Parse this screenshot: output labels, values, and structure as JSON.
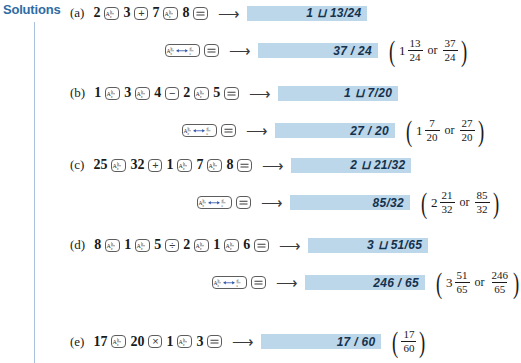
{
  "heading": {
    "label": "Solutions"
  },
  "icons": {
    "abc_key": "fraction-abc-key-icon",
    "toggle_key": "fraction-toggle-key-icon",
    "equals_key": "equals-key-icon",
    "arrow": "right-arrow-icon"
  },
  "keys": {
    "plus": "+",
    "minus": "−",
    "divide": "÷",
    "times": "×"
  },
  "rows": [
    {
      "tag": "(a)",
      "sequence": [
        {
          "type": "num",
          "text": "2"
        },
        {
          "type": "key_abc"
        },
        {
          "type": "num",
          "text": "3"
        },
        {
          "type": "key_op",
          "text": "+"
        },
        {
          "type": "num",
          "text": "7"
        },
        {
          "type": "key_abc"
        },
        {
          "type": "num",
          "text": "8"
        },
        {
          "type": "key_eq"
        }
      ],
      "display": "1 ⊔ 13/24",
      "paren": null
    },
    {
      "tag": "",
      "secondary": true,
      "sequence": [
        {
          "type": "key_toggle"
        },
        {
          "type": "key_eq"
        }
      ],
      "display": "37 / 24",
      "paren": {
        "whole": "1",
        "n1": "13",
        "d1": "24",
        "or": "or",
        "n2": "37",
        "d2": "24"
      }
    },
    {
      "tag": "(b)",
      "sequence": [
        {
          "type": "num",
          "text": "1"
        },
        {
          "type": "key_abc"
        },
        {
          "type": "num",
          "text": "3"
        },
        {
          "type": "key_abc"
        },
        {
          "type": "num",
          "text": "4"
        },
        {
          "type": "key_op",
          "text": "−"
        },
        {
          "type": "num",
          "text": "2"
        },
        {
          "type": "key_abc"
        },
        {
          "type": "num",
          "text": "5"
        },
        {
          "type": "key_eq"
        }
      ],
      "display": "1 ⊔ 7/20",
      "paren": null
    },
    {
      "tag": "",
      "secondary": true,
      "sequence": [
        {
          "type": "key_toggle"
        },
        {
          "type": "key_eq"
        }
      ],
      "display": "27 / 20",
      "paren": {
        "whole": "1",
        "n1": "7",
        "d1": "20",
        "or": "or",
        "n2": "27",
        "d2": "20"
      }
    },
    {
      "tag": "(c)",
      "sequence": [
        {
          "type": "num",
          "text": "25"
        },
        {
          "type": "key_abc"
        },
        {
          "type": "num",
          "text": "32"
        },
        {
          "type": "key_op",
          "text": "+"
        },
        {
          "type": "num",
          "text": "1"
        },
        {
          "type": "key_abc"
        },
        {
          "type": "num",
          "text": "7"
        },
        {
          "type": "key_abc"
        },
        {
          "type": "num",
          "text": "8"
        },
        {
          "type": "key_eq"
        }
      ],
      "display": "2 ⊔ 21/32",
      "paren": null
    },
    {
      "tag": "",
      "secondary": true,
      "sequence": [
        {
          "type": "key_toggle"
        },
        {
          "type": "key_eq"
        }
      ],
      "display": "85/32",
      "paren": {
        "whole": "2",
        "n1": "21",
        "d1": "32",
        "or": "or",
        "n2": "85",
        "d2": "32"
      }
    },
    {
      "tag": "(d)",
      "sequence": [
        {
          "type": "num",
          "text": "8"
        },
        {
          "type": "key_abc"
        },
        {
          "type": "num",
          "text": "1"
        },
        {
          "type": "key_abc"
        },
        {
          "type": "num",
          "text": "5"
        },
        {
          "type": "key_op",
          "text": "÷"
        },
        {
          "type": "num",
          "text": "2"
        },
        {
          "type": "key_abc"
        },
        {
          "type": "num",
          "text": "1"
        },
        {
          "type": "key_abc"
        },
        {
          "type": "num",
          "text": "6"
        },
        {
          "type": "key_eq"
        }
      ],
      "display": "3 ⊔ 51/65",
      "paren": null
    },
    {
      "tag": "",
      "secondary": true,
      "sequence": [
        {
          "type": "key_toggle"
        },
        {
          "type": "key_eq"
        }
      ],
      "display": "246 / 65",
      "paren": {
        "whole": "3",
        "n1": "51",
        "d1": "65",
        "or": "or",
        "n2": "246",
        "d2": "65"
      }
    },
    {
      "tag": "(e)",
      "sequence": [
        {
          "type": "num",
          "text": "17"
        },
        {
          "type": "key_abc"
        },
        {
          "type": "num",
          "text": "20"
        },
        {
          "type": "key_op",
          "text": "×"
        },
        {
          "type": "num",
          "text": "1"
        },
        {
          "type": "key_abc"
        },
        {
          "type": "num",
          "text": "3"
        },
        {
          "type": "key_eq"
        }
      ],
      "display": "17 / 60",
      "paren": {
        "whole": "",
        "n1": "17",
        "d1": "60",
        "or": "",
        "n2": "",
        "d2": ""
      }
    }
  ],
  "layout": {
    "row_tops": [
      5,
      38,
      85,
      118,
      157,
      190,
      237,
      270,
      329
    ],
    "row_lefts": [
      70,
      163,
      70,
      180,
      70,
      195,
      70,
      210,
      70
    ],
    "display_widths": [
      120,
      120,
      120,
      120,
      120,
      120,
      120,
      120,
      120
    ]
  },
  "colors": {
    "heading": "#2e6ca3",
    "rule": "#a8c2dc",
    "display_band": "#bcd6ea",
    "lcd_text": "#15324d",
    "key_border": "#5d5d5d"
  }
}
